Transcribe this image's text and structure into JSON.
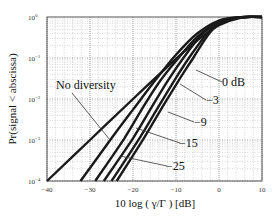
{
  "chart_data": {
    "type": "line",
    "title": "",
    "xlabel": "10 log ( γ/Γ ) [dB]",
    "ylabel": "Pr(signal < abscissa)",
    "xlim": [
      -40,
      10
    ],
    "ylim": [
      0.0001,
      1
    ],
    "yscale": "log",
    "grid": true,
    "x_ticks": [
      "-40",
      "-30",
      "-20",
      "-10",
      "0",
      "10"
    ],
    "y_ticks": [
      "10^0",
      "10^-1",
      "10^-2",
      "10^-3",
      "10^-4"
    ],
    "legend": null,
    "series": [
      {
        "name": "No diversity",
        "points": [
          [
            -40,
            0.0001
          ],
          [
            -30,
            0.001
          ],
          [
            -20,
            0.01
          ],
          [
            -10,
            0.095
          ],
          [
            -5,
            0.27
          ],
          [
            0,
            0.63
          ],
          [
            5,
            0.96
          ],
          [
            10,
            1.0
          ]
        ]
      },
      {
        "name": "0 dB",
        "points": [
          [
            -32.2,
            0.0001
          ],
          [
            -25,
            0.0011
          ],
          [
            -20,
            0.0055
          ],
          [
            -15,
            0.027
          ],
          [
            -10,
            0.12
          ],
          [
            -5,
            0.4
          ],
          [
            0,
            0.82
          ],
          [
            5,
            0.99
          ],
          [
            10,
            1.0
          ]
        ]
      },
      {
        "name": "-3",
        "points": [
          [
            -28.8,
            0.0001
          ],
          [
            -22,
            0.0011
          ],
          [
            -18,
            0.0055
          ],
          [
            -14,
            0.025
          ],
          [
            -10,
            0.085
          ],
          [
            -5,
            0.33
          ],
          [
            0,
            0.78
          ],
          [
            5,
            0.99
          ],
          [
            10,
            1.0
          ]
        ]
      },
      {
        "name": "-9",
        "points": [
          [
            -26.8,
            0.0001
          ],
          [
            -20,
            0.0011
          ],
          [
            -16,
            0.0055
          ],
          [
            -12,
            0.027
          ],
          [
            -8,
            0.11
          ],
          [
            -4,
            0.37
          ],
          [
            0,
            0.74
          ],
          [
            5,
            0.99
          ],
          [
            10,
            1.0
          ]
        ]
      },
      {
        "name": "-15",
        "points": [
          [
            -25.0,
            0.0001
          ],
          [
            -18.5,
            0.0011
          ],
          [
            -14.5,
            0.0055
          ],
          [
            -10.5,
            0.027
          ],
          [
            -7,
            0.1
          ],
          [
            -3,
            0.37
          ],
          [
            0,
            0.7
          ],
          [
            5,
            0.98
          ],
          [
            10,
            1.0
          ]
        ]
      },
      {
        "name": "-25",
        "points": [
          [
            -23.8,
            0.0001
          ],
          [
            -17.5,
            0.0011
          ],
          [
            -13.5,
            0.0055
          ],
          [
            -9.5,
            0.027
          ],
          [
            -6,
            0.1
          ],
          [
            -2.5,
            0.37
          ],
          [
            0,
            0.66
          ],
          [
            5,
            0.98
          ],
          [
            10,
            1.0
          ]
        ]
      }
    ],
    "annotations": [
      {
        "text": "No diversity",
        "target_series": "No diversity"
      },
      {
        "text": "0 dB",
        "target_series": "0 dB"
      },
      {
        "text": "–3",
        "target_series": "-3"
      },
      {
        "text": "–9",
        "target_series": "-9"
      },
      {
        "text": "–15",
        "target_series": "-15"
      },
      {
        "text": "–25",
        "target_series": "-25"
      }
    ]
  },
  "labels": {
    "xlabel": "10 log ( γ/Γ ) [dB]",
    "ylabel": "Pr(signal < abscissa)",
    "x_ticks": [
      "−40",
      "−30",
      "−20",
      "−10",
      "0",
      "10"
    ],
    "y_tick_base": "10",
    "y_tick_exps": [
      "0",
      "−1",
      "−2",
      "−3",
      "−4"
    ],
    "annotations": [
      "No diversity",
      "0 dB",
      "−3",
      "−9",
      "−15",
      "−25"
    ]
  }
}
